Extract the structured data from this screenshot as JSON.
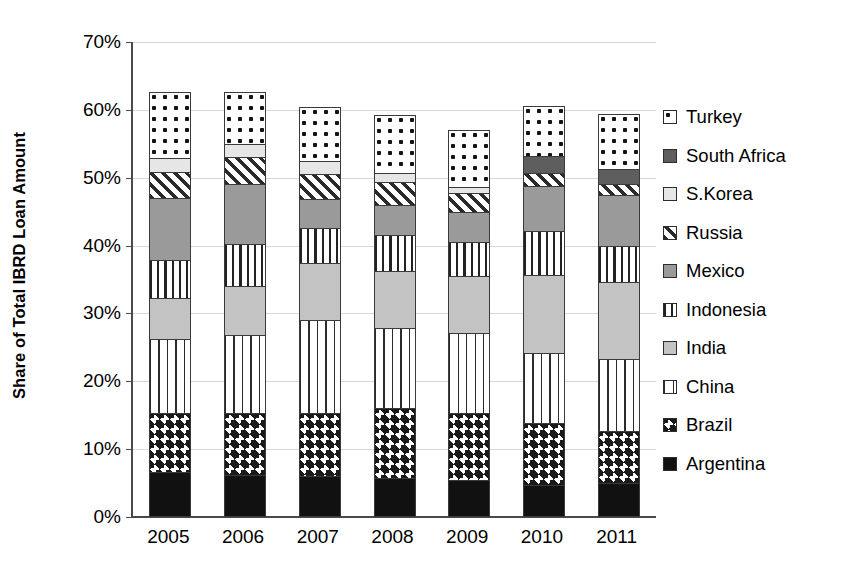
{
  "chart_data": {
    "type": "bar",
    "subtype": "stacked-bar",
    "title": "",
    "xlabel": "",
    "ylabel": "Share of Total IBRD Loan Amount",
    "ylim": [
      0,
      70
    ],
    "ytick_step": 10,
    "ytick_labels": [
      "0%",
      "10%",
      "20%",
      "30%",
      "40%",
      "50%",
      "60%",
      "70%"
    ],
    "ytick_values": [
      0,
      10,
      20,
      30,
      40,
      50,
      60,
      70
    ],
    "grid": true,
    "legend_position": "right",
    "legend_order_top_to_bottom": [
      "Turkey",
      "South Africa",
      "S.Korea",
      "Russia",
      "Mexico",
      "Indonesia",
      "India",
      "China",
      "Brazil",
      "Argentina"
    ],
    "categories": [
      "2005",
      "2006",
      "2007",
      "2008",
      "2009",
      "2010",
      "2011"
    ],
    "stack_order_bottom_to_top": [
      "Argentina",
      "Brazil",
      "China",
      "India",
      "Indonesia",
      "Mexico",
      "Russia",
      "S.Korea",
      "South Africa",
      "Turkey"
    ],
    "series": [
      {
        "name": "Argentina",
        "pattern": "solid-black",
        "values": [
          6.6,
          6.2,
          6.1,
          5.7,
          5.5,
          4.7,
          5.0
        ]
      },
      {
        "name": "Brazil",
        "pattern": "checkerboard",
        "values": [
          8.7,
          9.1,
          9.3,
          10.4,
          9.9,
          9.1,
          7.7
        ]
      },
      {
        "name": "China",
        "pattern": "dashed-vertical",
        "values": [
          11.0,
          11.5,
          13.6,
          11.8,
          11.7,
          10.3,
          10.6
        ]
      },
      {
        "name": "India",
        "pattern": "light-gray",
        "values": [
          6.0,
          7.3,
          8.5,
          8.4,
          8.4,
          11.5,
          11.3
        ]
      },
      {
        "name": "Indonesia",
        "pattern": "vertical-lines",
        "values": [
          5.6,
          6.2,
          5.1,
          5.3,
          5.0,
          6.6,
          5.4
        ]
      },
      {
        "name": "Mexico",
        "pattern": "medium-gray",
        "values": [
          9.1,
          8.8,
          4.3,
          4.4,
          4.4,
          6.6,
          7.4
        ]
      },
      {
        "name": "Russia",
        "pattern": "diagonal-stripe",
        "values": [
          3.8,
          3.9,
          3.7,
          3.4,
          2.8,
          1.9,
          1.7
        ]
      },
      {
        "name": "S.Korea",
        "pattern": "very-light-gray",
        "values": [
          2.1,
          2.0,
          1.8,
          1.3,
          1.0,
          0.0,
          0.0
        ]
      },
      {
        "name": "South Africa",
        "pattern": "dark-gray",
        "values": [
          0.0,
          0.0,
          0.0,
          0.0,
          0.0,
          2.5,
          2.2
        ]
      },
      {
        "name": "Turkey",
        "pattern": "polka-dots",
        "values": [
          9.7,
          7.7,
          8.0,
          8.5,
          8.4,
          7.4,
          8.1
        ]
      }
    ],
    "bar_totals": [
      62.6,
      62.7,
      60.4,
      59.2,
      57.1,
      60.6,
      59.4
    ]
  },
  "legend": {
    "items": [
      {
        "label": "Turkey",
        "pattern_class": "p-turkey"
      },
      {
        "label": "South Africa",
        "pattern_class": "p-southafrica"
      },
      {
        "label": "S.Korea",
        "pattern_class": "p-skorea"
      },
      {
        "label": "Russia",
        "pattern_class": "p-russia"
      },
      {
        "label": "Mexico",
        "pattern_class": "p-mexico"
      },
      {
        "label": "Indonesia",
        "pattern_class": "p-indonesia"
      },
      {
        "label": "India",
        "pattern_class": "p-india"
      },
      {
        "label": "China",
        "pattern_class": "p-china"
      },
      {
        "label": "Brazil",
        "pattern_class": "p-brazil"
      },
      {
        "label": "Argentina",
        "pattern_class": "p-argentina"
      }
    ]
  },
  "colors": {
    "axis": "#4a4a4a",
    "grid": "#d8d8d8",
    "segment_border": "#3a3a3a",
    "background": "#ffffff"
  }
}
